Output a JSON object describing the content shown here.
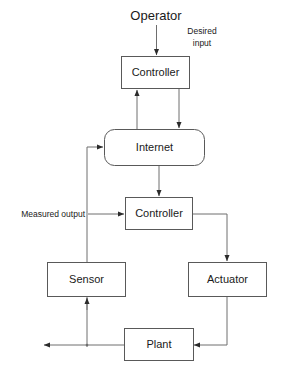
{
  "diagram": {
    "background_color": "#ffffff",
    "line_color": "#6e6e6e",
    "box_stroke_color": "#595959",
    "text_color": "#1a1a1a",
    "nodes": {
      "controller_top": "Controller",
      "internet": "Internet",
      "controller_bottom": "Controller",
      "sensor": "Sensor",
      "actuator": "Actuator",
      "plant": "Plant"
    },
    "labels": {
      "operator": "Operator",
      "desired_input_line1": "Desired",
      "desired_input_line2": "input",
      "measured_output": "Measured output"
    }
  }
}
